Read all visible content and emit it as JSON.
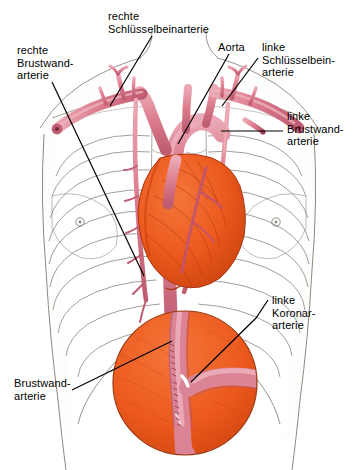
{
  "figure": {
    "type": "anatomical-illustration",
    "width": 356,
    "height": 470,
    "background": "#ffffff"
  },
  "colors": {
    "artery_pink": "#DD7F90",
    "artery_pink_dark": "#C05C71",
    "artery_pink_light": "#EAA7B3",
    "heart_orange": "#EC5A1E",
    "heart_orange_dark": "#C9400F",
    "heart_orange_light": "#F47B3E",
    "outline": "#000000",
    "skin_line": "#8A8276",
    "stipple": "#9A9488",
    "bone_line": "#6E6A63",
    "text": "#000000"
  },
  "labels": [
    {
      "id": "rechte-schluesselbeinarterie",
      "lines": [
        "rechte",
        "Schlüsselbeinarterie"
      ],
      "text": "rechte\nSchlüsselbeinarterie"
    },
    {
      "id": "aorta",
      "lines": [
        "Aorta"
      ],
      "text": "Aorta"
    },
    {
      "id": "linke-schluesselbeinarterie",
      "lines": [
        "linke",
        "Schlüsselbein-",
        "arterie"
      ],
      "text": "linke\nSchlüsselbein-\narterie"
    },
    {
      "id": "rechte-brustwandarterie",
      "lines": [
        "rechte",
        "Brustwand-",
        "arterie"
      ],
      "text": "rechte\nBrustwand-\narterie"
    },
    {
      "id": "linke-brustwandarterie",
      "lines": [
        "linke",
        "Brustwand-",
        "arterie"
      ],
      "text": "linke\nBrustwand-\narterie"
    },
    {
      "id": "linke-koronararterie",
      "lines": [
        "linke",
        "Koronar-",
        "arterie"
      ],
      "text": "linke\nKoronar-\narterie"
    },
    {
      "id": "brustwandarterie",
      "lines": [
        "Brustwand-",
        "arterie"
      ],
      "text": "Brustwand-\narterie"
    }
  ],
  "structures": [
    {
      "name": "thorax-outline",
      "description": "Umriss des Brustkorbs mit Schultern und Hals"
    },
    {
      "name": "rib-cage",
      "description": "Rippen beidseitig, dünne Konturlinien"
    },
    {
      "name": "aortic-arch",
      "description": "Aortenbogen, rosa"
    },
    {
      "name": "descending-aorta",
      "description": "absteigende Aorta, rosa"
    },
    {
      "name": "heart",
      "description": "Herz, orange"
    },
    {
      "name": "subclavian-arteries",
      "description": "Schlüsselbeinarterien links und rechts"
    },
    {
      "name": "internal-thoracic-arteries",
      "description": "Brustwandarterien links und rechts"
    },
    {
      "name": "coronary-artery",
      "description": "linke Koronararterie auf dem Herzen"
    },
    {
      "name": "magnified-inset",
      "description": "Kreisförmige Vergrößerung: Bypass-Anastomose der Brustwandarterie auf der Koronararterie"
    }
  ]
}
